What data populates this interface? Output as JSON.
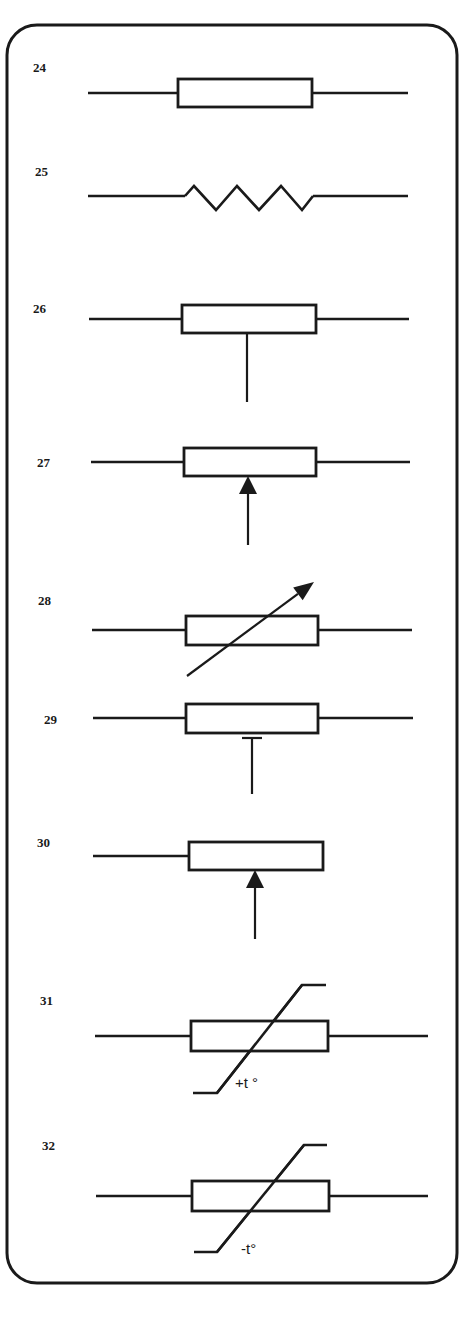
{
  "diagram": {
    "frame": {
      "x": 7,
      "y": 25,
      "width": 450,
      "height": 1258,
      "radius": 30
    },
    "ink_color": "#1a1a1a",
    "symbols": [
      {
        "number": "24",
        "type": "fixed-resistor-box",
        "label_pos": [
          33,
          72
        ],
        "wire_y": 93,
        "wire_left": [
          88,
          178
        ],
        "box": [
          178,
          79,
          134,
          28
        ],
        "wire_right": [
          312,
          408
        ]
      },
      {
        "number": "25",
        "type": "fixed-resistor-zigzag",
        "label_pos": [
          35,
          176
        ],
        "wire_y": 196,
        "wire_left": [
          88,
          185
        ],
        "zigzag_points": "185,196 194,186 216,210 237,186 259,210 281,186 302,210 313,196",
        "wire_right": [
          313,
          408
        ]
      },
      {
        "number": "26",
        "type": "resistor-with-tap",
        "label_pos": [
          33,
          313
        ],
        "wire_y": 319,
        "wire_left": [
          89,
          182
        ],
        "box": [
          182,
          305,
          134,
          28
        ],
        "wire_right": [
          316,
          409
        ],
        "tap": {
          "x": 247,
          "y1": 333,
          "y2": 402
        }
      },
      {
        "number": "27",
        "type": "potentiometer-arrow-wiper",
        "label_pos": [
          37,
          467
        ],
        "wire_y": 462,
        "wire_left": [
          91,
          184
        ],
        "box": [
          184,
          448,
          132,
          28
        ],
        "wire_right": [
          316,
          410
        ],
        "wiper": {
          "x": 248,
          "tip_y": 476,
          "base_y": 545,
          "head_len": 18,
          "head_half": 9
        }
      },
      {
        "number": "28",
        "type": "variable-resistor-arrow",
        "label_pos": [
          38,
          605
        ],
        "wire_y": 630,
        "wire_left": [
          92,
          186
        ],
        "box": [
          186,
          616,
          132,
          29
        ],
        "wire_right": [
          318,
          412
        ],
        "arrow": {
          "x1": 187,
          "y1": 676,
          "x2": 314,
          "y2": 582
        }
      },
      {
        "number": "29",
        "type": "preset-resistor",
        "label_pos": [
          44,
          724
        ],
        "wire_y": 718,
        "wire_left": [
          93,
          186
        ],
        "box": [
          186,
          704,
          132,
          29
        ],
        "wire_right": [
          318,
          413
        ],
        "tap": {
          "x": 252,
          "bar_y": 738,
          "bar_half": 10,
          "y2": 794
        }
      },
      {
        "number": "30",
        "type": "rheostat-arrow-wiper",
        "label_pos": [
          37,
          847
        ],
        "wire_y": 856,
        "wire_left": [
          93,
          189
        ],
        "box": [
          189,
          842,
          134,
          28
        ],
        "wire_right": null,
        "wiper": {
          "x": 255,
          "tip_y": 870,
          "base_y": 939,
          "head_len": 18,
          "head_half": 9
        }
      },
      {
        "number": "31",
        "type": "thermistor-ptc",
        "label_pos": [
          40,
          1005
        ],
        "wire_y": 1036,
        "wire_left": [
          95,
          191
        ],
        "box": [
          191,
          1021,
          137,
          30
        ],
        "wire_right": [
          328,
          428
        ],
        "curve_points": "193,1093 217,1093 302,985 326,985",
        "temp_label": "+t °",
        "temp_label_pos": [
          235,
          1088
        ]
      },
      {
        "number": "32",
        "type": "thermistor-ntc",
        "label_pos": [
          42,
          1150
        ],
        "wire_y": 1196,
        "wire_left": [
          96,
          192
        ],
        "box": [
          192,
          1181,
          137,
          30
        ],
        "wire_right": [
          329,
          428
        ],
        "curve_points": "194,1252 217,1252 304,1145 327,1145",
        "temp_label": "-t°",
        "temp_label_pos": [
          241,
          1254
        ]
      }
    ]
  }
}
